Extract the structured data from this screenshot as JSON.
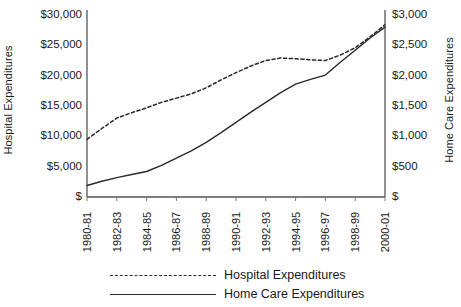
{
  "chart_data": {
    "type": "line",
    "title": "",
    "xlabel": "",
    "ylabel": "Hospital Expenditures",
    "y2label": "Home Care Expenditures",
    "grid": false,
    "legend_position": "bottom",
    "categories": [
      "1980-81",
      "1981-82",
      "1982-83",
      "1983-84",
      "1984-85",
      "1985-86",
      "1986-87",
      "1987-88",
      "1988-89",
      "1989-90",
      "1990-91",
      "1991-92",
      "1992-93",
      "1993-94",
      "1994-95",
      "1995-96",
      "1996-97",
      "1997-98",
      "1998-99",
      "1999-00",
      "2000-01"
    ],
    "xtick_labels": [
      "1980-81",
      "1982-83",
      "1984-85",
      "1986-87",
      "1988-89",
      "1990-91",
      "1992-93",
      "1994-95",
      "1996-97",
      "1998-99",
      "2000-01"
    ],
    "ylim": [
      0,
      30000
    ],
    "ytick_labels": [
      "$30,000",
      "$25,000",
      "$20,000",
      "$15,000",
      "$10,000",
      "$5,000",
      "$"
    ],
    "ytick_values": [
      30000,
      25000,
      20000,
      15000,
      10000,
      5000,
      0
    ],
    "y2lim": [
      0,
      3000
    ],
    "y2tick_labels": [
      "$3,000",
      "$2,500",
      "$2,000",
      "$1,500",
      "$1,000",
      "$500",
      "$"
    ],
    "y2tick_values": [
      3000,
      2500,
      2000,
      1500,
      1000,
      500,
      0
    ],
    "series": [
      {
        "name": "Hospital Expenditures",
        "axis": "left",
        "style": "dashed",
        "color": "#2a2a2a",
        "values": [
          9500,
          11300,
          13000,
          13900,
          14700,
          15600,
          16300,
          17000,
          18000,
          19300,
          20500,
          21600,
          22500,
          22900,
          22800,
          22600,
          22500,
          23400,
          24600,
          26400,
          28400
        ]
      },
      {
        "name": "Home Care Expenditures",
        "axis": "right",
        "style": "solid",
        "color": "#2a2a2a",
        "values": [
          190,
          260,
          320,
          370,
          420,
          520,
          640,
          760,
          900,
          1060,
          1230,
          1400,
          1560,
          1720,
          1860,
          1940,
          2010,
          2220,
          2420,
          2620,
          2800
        ]
      }
    ],
    "legend": [
      {
        "label": "Hospital Expenditures",
        "style": "dashed"
      },
      {
        "label": "Home Care Expenditures",
        "style": "solid"
      }
    ]
  }
}
